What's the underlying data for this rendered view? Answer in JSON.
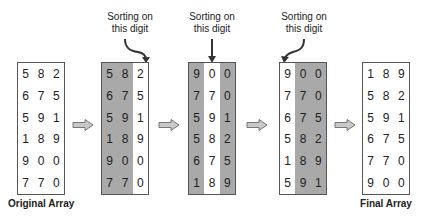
{
  "diagram": {
    "colors": {
      "highlight_fill": "#a9a9a9",
      "border": "#555555",
      "arrow_fill": "#c8c8c8",
      "arrow_stroke": "#777777"
    },
    "annotation_text": {
      "line1": "Sorting on",
      "line2": "this digit"
    },
    "arrays": [
      {
        "id": "original",
        "caption": "Original Array",
        "highlight_columns": [],
        "rows": [
          [
            "5",
            "8",
            "2"
          ],
          [
            "6",
            "7",
            "5"
          ],
          [
            "5",
            "9",
            "1"
          ],
          [
            "1",
            "8",
            "9"
          ],
          [
            "9",
            "0",
            "0"
          ],
          [
            "7",
            "7",
            "0"
          ]
        ]
      },
      {
        "id": "step1",
        "annotation": "Sorting on this digit",
        "sorted_column": 2,
        "highlight_columns": [
          0,
          1
        ],
        "rows": [
          [
            "5",
            "8",
            "2"
          ],
          [
            "6",
            "7",
            "5"
          ],
          [
            "5",
            "9",
            "1"
          ],
          [
            "1",
            "8",
            "9"
          ],
          [
            "9",
            "0",
            "0"
          ],
          [
            "7",
            "7",
            "0"
          ]
        ]
      },
      {
        "id": "step2",
        "annotation": "Sorting on this digit",
        "sorted_column": 1,
        "highlight_columns": [
          0,
          2
        ],
        "rows": [
          [
            "9",
            "0",
            "0"
          ],
          [
            "7",
            "7",
            "0"
          ],
          [
            "5",
            "9",
            "1"
          ],
          [
            "5",
            "8",
            "2"
          ],
          [
            "6",
            "7",
            "5"
          ],
          [
            "1",
            "8",
            "9"
          ]
        ]
      },
      {
        "id": "step3",
        "annotation": "Sorting on this digit",
        "sorted_column": 0,
        "highlight_columns": [
          1,
          2
        ],
        "rows": [
          [
            "9",
            "0",
            "0"
          ],
          [
            "7",
            "7",
            "0"
          ],
          [
            "6",
            "7",
            "5"
          ],
          [
            "5",
            "8",
            "2"
          ],
          [
            "1",
            "8",
            "9"
          ],
          [
            "5",
            "9",
            "1"
          ]
        ]
      },
      {
        "id": "final",
        "caption": "Final Array",
        "highlight_columns": [],
        "rows": [
          [
            "1",
            "8",
            "9"
          ],
          [
            "5",
            "8",
            "2"
          ],
          [
            "5",
            "9",
            "1"
          ],
          [
            "6",
            "7",
            "5"
          ],
          [
            "7",
            "7",
            "0"
          ],
          [
            "9",
            "0",
            "0"
          ]
        ]
      }
    ]
  }
}
